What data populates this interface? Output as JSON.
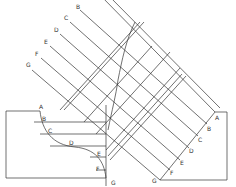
{
  "diagram": {
    "type": "auxiliary-projection",
    "stroke_color": "#333333",
    "background": "#ffffff",
    "projector_labels_top": [
      "B",
      "C",
      "D",
      "E",
      "F",
      "G"
    ],
    "front_view": {
      "curve_labels": [
        "A",
        "B",
        "C",
        "D",
        "E",
        "F",
        "G"
      ]
    },
    "auxiliary_view": {
      "edge_labels": [
        "A",
        "B",
        "C",
        "D",
        "E",
        "F",
        "G"
      ]
    },
    "extra_label": "G"
  }
}
